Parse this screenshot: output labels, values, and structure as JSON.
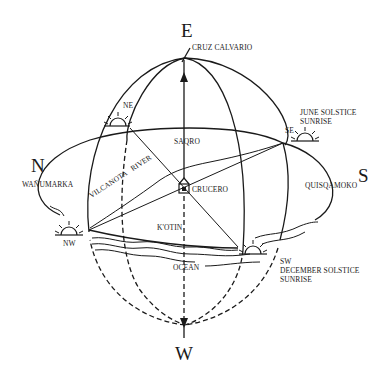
{
  "diagram": {
    "cardinal": {
      "east": "E",
      "north": "N",
      "south": "S",
      "west": "W"
    },
    "places": {
      "top": "CRUZ CALVARIO",
      "north": "WAÑUMARKA",
      "south": "QUISQAMOKO",
      "upper": "SAQRO",
      "center": "CRUCERO",
      "lower": "K'OTIN",
      "ocean": "OCEAN",
      "river": "VILCANOTA   RIVER"
    },
    "sun_points": {
      "ne": "NE",
      "se": "SE",
      "nw": "NW",
      "sw": "SW"
    },
    "annotations": {
      "june_line1": "JUNE SOLSTICE",
      "june_line2": "SUNRISE",
      "dec_line1": "DECEMBER SOLSTICE",
      "dec_line2": "SUNRISE"
    }
  }
}
